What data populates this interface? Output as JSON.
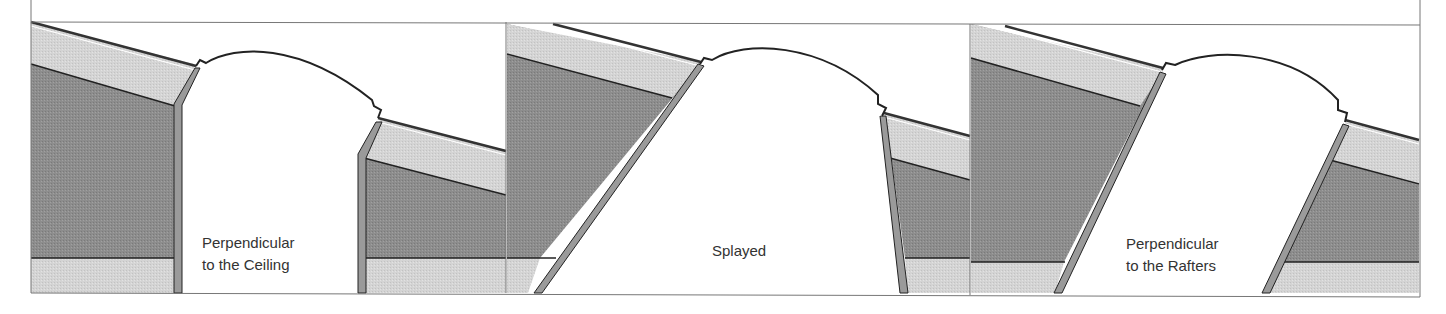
{
  "figure": {
    "panels": [
      {
        "id": "ceiling",
        "label_lines": [
          "Perpendicular",
          "to the Ceiling"
        ]
      },
      {
        "id": "splayed",
        "label_lines": [
          "Splayed"
        ]
      },
      {
        "id": "rafters",
        "label_lines": [
          "Perpendicular",
          "to the Rafters"
        ]
      }
    ]
  },
  "colors": {
    "dark_fill": "#8f8f8f",
    "light_fill": "#d2d2d2",
    "line": "#222222",
    "frame": "#777777",
    "liner": "#9a9a9a"
  }
}
